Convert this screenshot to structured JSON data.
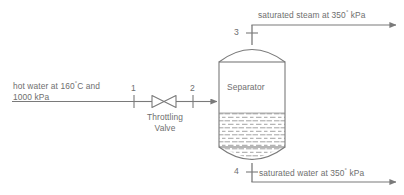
{
  "diagram": {
    "line_color": "#7a7a7a",
    "text_color": "#6e6e6e",
    "fill_color": "#ffffff",
    "inlet": {
      "label_line1": "hot water at 160",
      "label_degree": "°",
      "label_line1_tail": "C and",
      "label_line2": "1000 kPa",
      "full_text": "hot water at 160°C and 1000 kPa"
    },
    "valve": {
      "name_line1": "Throttling",
      "name_line2": "Valve",
      "full_text": "Throttling Valve",
      "symbol": "bowtie-valve-icon"
    },
    "vessel": {
      "label": "Separator",
      "liquid_fill": "dashed-liquid-pattern"
    },
    "streams": [
      {
        "id": "1",
        "name": "state-point-1"
      },
      {
        "id": "2",
        "name": "state-point-2"
      },
      {
        "id": "3",
        "name": "state-point-3"
      },
      {
        "id": "4",
        "name": "state-point-4"
      }
    ],
    "top_outlet": {
      "text_head": "saturated steam at 350",
      "degree": "°",
      "text_tail": " kPa",
      "full_text": "saturated steam at 350° kPa"
    },
    "bottom_outlet": {
      "text_head": "saturated water at 350",
      "degree": "°",
      "text_tail": " kPa",
      "full_text": "saturated water at 350° kPa"
    }
  }
}
